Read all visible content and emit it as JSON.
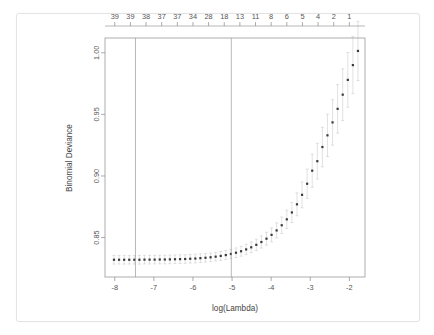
{
  "figure": {
    "kind": "cv-glmnet-plot",
    "background": "#ffffff",
    "card_border": "#e4e4e4"
  },
  "chart_data": {
    "type": "scatter",
    "title": "",
    "xlabel": "log(Lambda)",
    "ylabel": "Binomial Deviance",
    "xlim": [
      -8.25,
      -1.6
    ],
    "ylim": [
      0.818,
      1.012
    ],
    "grid": false,
    "legend": null,
    "point_color": "#3a3a3a",
    "errorbar_color": "#c8c8c8",
    "vline_color": "#9a9a9a",
    "xticks": [
      -8,
      -7,
      -6,
      -5,
      -4,
      -3,
      -2
    ],
    "xtick_labels": [
      "-8",
      "-7",
      "-6",
      "-5",
      "-4",
      "-3",
      "-2"
    ],
    "yticks": [
      0.85,
      0.9,
      0.95,
      1.0
    ],
    "ytick_labels": [
      "0.85",
      "0.90",
      "0.95",
      "1.00"
    ],
    "top_axis_label": "",
    "top_ticks": [
      -8.0,
      -7.6,
      -7.2,
      -6.8,
      -6.4,
      -6.0,
      -5.6,
      -5.2,
      -4.8,
      -4.4,
      -4.0,
      -3.6,
      -3.2,
      -2.8,
      -2.4,
      -2.0
    ],
    "top_tick_labels": [
      "39",
      "39",
      "38",
      "37",
      "37",
      "34",
      "28",
      "18",
      "13",
      "11",
      "8",
      "6",
      "5",
      "4",
      "2",
      "1"
    ],
    "vlines": [
      -7.47,
      -5.02
    ],
    "x": [
      -8.02,
      -7.89,
      -7.76,
      -7.63,
      -7.5,
      -7.37,
      -7.24,
      -7.11,
      -6.98,
      -6.85,
      -6.72,
      -6.59,
      -6.46,
      -6.33,
      -6.2,
      -6.07,
      -5.94,
      -5.81,
      -5.68,
      -5.55,
      -5.42,
      -5.29,
      -5.16,
      -5.03,
      -4.9,
      -4.77,
      -4.64,
      -4.51,
      -4.38,
      -4.25,
      -4.12,
      -3.99,
      -3.86,
      -3.73,
      -3.6,
      -3.47,
      -3.34,
      -3.21,
      -3.08,
      -2.95,
      -2.82,
      -2.69,
      -2.56,
      -2.43,
      -2.3,
      -2.17,
      -2.04,
      -1.91,
      -1.78
    ],
    "y": [
      0.832,
      0.832,
      0.832,
      0.832,
      0.832,
      0.832,
      0.8321,
      0.8321,
      0.8321,
      0.8322,
      0.8322,
      0.8323,
      0.8324,
      0.8325,
      0.8326,
      0.8328,
      0.833,
      0.8333,
      0.8336,
      0.834,
      0.8345,
      0.8351,
      0.8358,
      0.8367,
      0.8377,
      0.8389,
      0.8404,
      0.8421,
      0.8441,
      0.8464,
      0.8491,
      0.8522,
      0.8558,
      0.86,
      0.8648,
      0.8704,
      0.877,
      0.8847,
      0.8937,
      0.9043,
      0.912,
      0.9235,
      0.933,
      0.9435,
      0.9545,
      0.966,
      0.978,
      0.99,
      1.0015
    ],
    "yerr_lower": [
      0.8285,
      0.8285,
      0.8285,
      0.8285,
      0.8285,
      0.8285,
      0.8286,
      0.8286,
      0.8286,
      0.8287,
      0.8287,
      0.8288,
      0.8289,
      0.829,
      0.8291,
      0.8293,
      0.8295,
      0.8298,
      0.8301,
      0.8305,
      0.831,
      0.8315,
      0.8321,
      0.8329,
      0.8338,
      0.8349,
      0.8362,
      0.8377,
      0.8395,
      0.8415,
      0.8439,
      0.8466,
      0.8497,
      0.8533,
      0.8574,
      0.8622,
      0.8677,
      0.8742,
      0.8818,
      0.8908,
      0.8975,
      0.9075,
      0.9158,
      0.925,
      0.9348,
      0.945,
      0.9558,
      0.9668,
      0.9775
    ],
    "yerr_upper": [
      0.8355,
      0.8355,
      0.8355,
      0.8355,
      0.8355,
      0.8355,
      0.8356,
      0.8356,
      0.8356,
      0.8357,
      0.8357,
      0.8358,
      0.8359,
      0.836,
      0.8361,
      0.8363,
      0.8365,
      0.8368,
      0.8371,
      0.8375,
      0.838,
      0.8387,
      0.8395,
      0.8405,
      0.8416,
      0.8429,
      0.8446,
      0.8465,
      0.8487,
      0.8513,
      0.8543,
      0.8578,
      0.8619,
      0.8667,
      0.8722,
      0.8786,
      0.8863,
      0.8952,
      0.9056,
      0.9178,
      0.9265,
      0.9395,
      0.9502,
      0.962,
      0.9742,
      0.987,
      1.0002,
      1.0132,
      1.0255
    ]
  }
}
